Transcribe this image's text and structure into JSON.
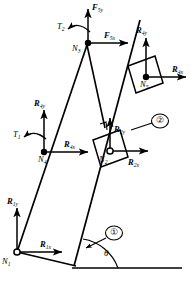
{
  "figure": {
    "type": "free-body-diagram",
    "background": "#ffffff",
    "stroke": "#000000",
    "width": 194,
    "height": 286
  },
  "links": [
    {
      "id": "link-1",
      "label": "①"
    },
    {
      "id": "link-2",
      "label": "②"
    }
  ],
  "angle": {
    "label": "θ"
  },
  "nodes": [
    {
      "id": "n1",
      "base": "N",
      "sub": "1",
      "style": "open-pivot"
    },
    {
      "id": "n2",
      "base": "N",
      "sub": "2",
      "style": "open-pivot"
    },
    {
      "id": "n3",
      "base": "N",
      "sub": "3",
      "style": "filled"
    },
    {
      "id": "n4",
      "base": "N",
      "sub": "4",
      "style": "filled"
    },
    {
      "id": "n5",
      "base": "N",
      "sub": "5",
      "style": "filled"
    }
  ],
  "torques": [
    {
      "id": "t1",
      "base": "T",
      "sub": "1"
    },
    {
      "id": "t2",
      "base": "T",
      "sub": "2"
    }
  ],
  "forces": [
    {
      "id": "r1y",
      "base": "R",
      "sub": "1y",
      "dir": "up"
    },
    {
      "id": "r1x",
      "base": "R",
      "sub": "1x",
      "dir": "right"
    },
    {
      "id": "r4y",
      "base": "R",
      "sub": "4y",
      "dir": "up"
    },
    {
      "id": "r4x",
      "base": "R",
      "sub": "4x",
      "dir": "right"
    },
    {
      "id": "f5y",
      "base": "F",
      "sub": "5y",
      "dir": "up"
    },
    {
      "id": "f5x",
      "base": "F",
      "sub": "5x",
      "dir": "right"
    },
    {
      "id": "r2y",
      "base": "R",
      "sub": "2y",
      "dir": "up"
    },
    {
      "id": "r2x",
      "base": "R",
      "sub": "2x",
      "dir": "right"
    },
    {
      "id": "r4y_b",
      "base": "R",
      "sub": "4y",
      "dir": "up"
    },
    {
      "id": "r4x_b",
      "base": "R",
      "sub": "4x",
      "dir": "right"
    }
  ]
}
